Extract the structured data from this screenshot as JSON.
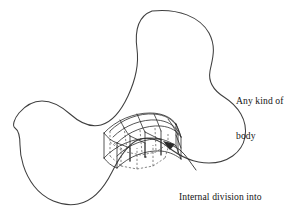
{
  "figure": {
    "type": "technical-diagram",
    "background_color": "#ffffff",
    "outline_color": "#3f3f3f",
    "mesh_color": "#2b2b2b",
    "hidden_edge_color": "#555555",
    "text_color": "#141414"
  },
  "labels": {
    "body": {
      "line1": "Any kind of",
      "line2": "body"
    },
    "mesh": {
      "line1": "Internal division into",
      "line2": "block-shaped elements"
    }
  },
  "annotations": {
    "leader_arrow": "curved-leader-arrow-to-mesh"
  },
  "shapes": {
    "body_outline": "three-lobed-closed-freeform-blob",
    "mesh_block": "curved-hexahedral-element-grid",
    "mesh_columns": 4,
    "mesh_rows": 3,
    "mesh_depth_layers": 2
  }
}
